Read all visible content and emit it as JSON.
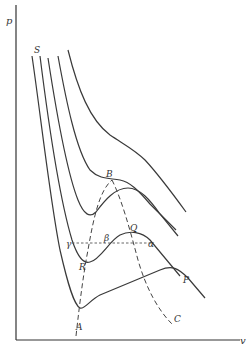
{
  "diagram": {
    "type": "p-v isotherms (van der Waals)",
    "axes": {
      "y_label": "p",
      "x_label": "v"
    },
    "labels": {
      "S": "S",
      "B": "B",
      "Q": "Q",
      "beta": "β",
      "alpha": "α",
      "gamma": "γ",
      "R": "R",
      "P": "P",
      "A": "A",
      "C": "C"
    },
    "curves": [
      {
        "id": "isotherm-1",
        "description": "lowest isotherm with minimum at A and maximum near right"
      },
      {
        "id": "isotherm-2",
        "description": "isotherm with minimum R and maximum Q, labelled P"
      },
      {
        "id": "isotherm-3",
        "description": "isotherm with small wiggle"
      },
      {
        "id": "isotherm-4",
        "description": "critical isotherm with inflection at B"
      },
      {
        "id": "isotherm-5",
        "description": "highest isotherm, monotone"
      }
    ],
    "dashed_curves": [
      {
        "id": "spinodal-ARB",
        "description": "dashed line through minima A, R to B"
      },
      {
        "id": "spinodal-BQC",
        "description": "dashed line through maxima from B, Q to C"
      }
    ],
    "dotted_line": {
      "id": "gamma-beta-alpha",
      "description": "horizontal dotted line γ–β–α"
    }
  }
}
